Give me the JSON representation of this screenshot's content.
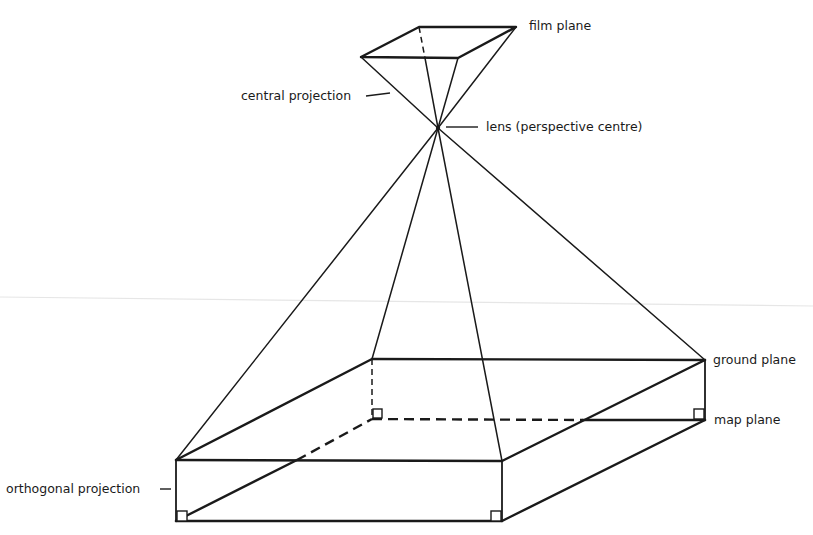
{
  "diagram": {
    "labels": {
      "film_plane": "film plane",
      "central_projection": "central projection",
      "lens": "lens (perspective centre)",
      "ground_plane": "ground plane",
      "map_plane": "map plane",
      "orthogonal_projection": "orthogonal projection"
    },
    "colors": {
      "line": "#1a1a1a",
      "background": "#ffffff"
    }
  }
}
